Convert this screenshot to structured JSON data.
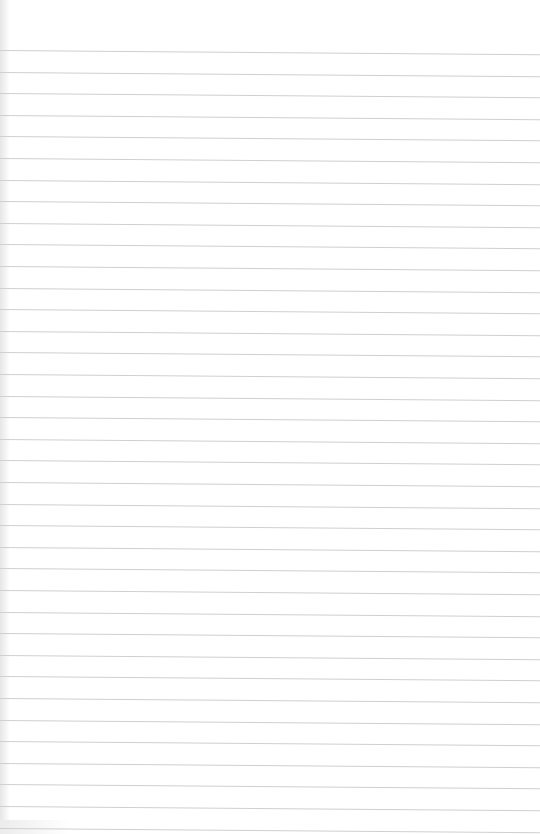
{
  "page": {
    "type": "lined-paper",
    "background_color": "#ffffff",
    "line_color": "#cfcfcf",
    "first_line_y": 50,
    "line_spacing": 21.6,
    "line_count": 37
  }
}
